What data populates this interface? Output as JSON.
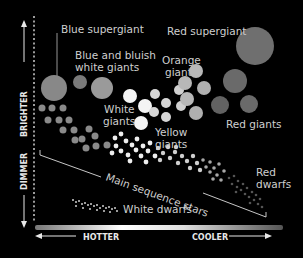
{
  "diagram": {
    "type": "Hertzsprung-Russell diagram",
    "background": "#000000",
    "axes": {
      "y_up_label": "BRIGHTER",
      "y_down_label": "DIMMER",
      "x_left_label": "HOTTER",
      "x_right_label": "COOLER"
    },
    "labels": {
      "blue_supergiant": "Blue supergiant",
      "blue_giants_line1": "Blue and bluish",
      "blue_giants_line2": "white giants",
      "red_supergiant": "Red supergiant",
      "orange_giants_line1": "Orange",
      "orange_giants_line2": "giants",
      "white_giants_line1": "White",
      "white_giants_line2": "giants",
      "yellow_giants_line1": "Yellow",
      "yellow_giants_line2": "giants",
      "red_giants": "Red giants",
      "main_sequence": "Main sequence stars",
      "red_dwarfs_line1": "Red",
      "red_dwarfs_line2": "dwarfs",
      "white_dwarfs": "White dwarfs"
    },
    "colors": {
      "label_text": "#cfcfcf",
      "axis_text": "#e8e8e8",
      "blue_star": "#8a8a8a",
      "white_star": "#f4f4f4",
      "yellow_star": "#d6d6d6",
      "orange_star": "#b8b8b8",
      "red_star": "#6a6a6a",
      "red_supergiant": "#6f6f6f"
    }
  }
}
